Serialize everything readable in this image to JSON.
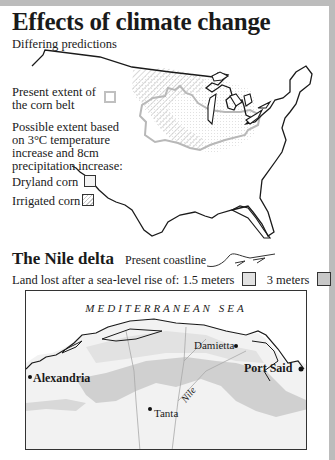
{
  "header": {
    "title": "Effects of climate change",
    "subtitle": "Differing predictions"
  },
  "corn_belt_map": {
    "legend": {
      "present_extent_line1": "Present extent of",
      "present_extent_line2": "the corn belt",
      "possible_line1": "Possible extent based",
      "possible_line2": "on 3°C temperature",
      "possible_line3": "increase and 8cm",
      "possible_line4": "precipitation increase:",
      "dryland": "Dryland corn",
      "irrigated": "Irrigated corn"
    },
    "colors": {
      "outline": "#1a1a1a",
      "corn_belt_border": "#b8b8b8",
      "dryland_fill": "#e8e8e8",
      "irrigated_hatch": "#c4c4c4"
    }
  },
  "nile_delta": {
    "title": "The Nile delta",
    "present_coastline_label": "Present coastline",
    "land_lost_label": "Land lost after a sea-level rise of: 1.5 meters",
    "three_meters_label": "3 meters",
    "sea_label": "MEDITERRANEAN SEA",
    "cities": {
      "alexandria": "Alexandria",
      "damietta": "Damietta",
      "port_said": "Port Said",
      "tanta": "Tanta"
    },
    "river_label": "Nile",
    "colors": {
      "land": "#f2f2f2",
      "loss_1_5m": "#e2e2e2",
      "loss_3m": "#c8c8c8"
    }
  }
}
